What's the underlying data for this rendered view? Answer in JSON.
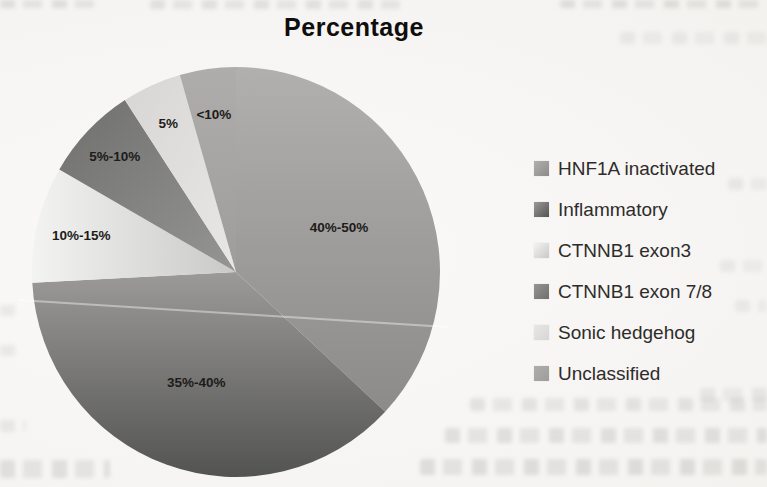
{
  "page": {
    "background_color": "#f6f5f3",
    "title_color": "#0f0e0c",
    "legend_text_color": "#2e2c2a"
  },
  "chart_data": {
    "type": "pie",
    "title": "Percentage",
    "legend_position": "right",
    "grid": false,
    "direction": "clockwise",
    "geometry": {
      "cx": 236,
      "cy": 272,
      "rx": 204,
      "ry": 205,
      "start_bearing_deg": 0
    },
    "slices": [
      {
        "name": "HNF1A inactivated",
        "label": "40%-50%",
        "angle_deg": 133,
        "share_pct": 36.9,
        "color_start": "#b1b0ae",
        "color_end": "#8c8b89",
        "gradient_dir": "down",
        "label_r": 0.55
      },
      {
        "name": "Inflammatory",
        "label": "35%-40%",
        "angle_deg": 134,
        "share_pct": 37.2,
        "color_start": "#9b9a98",
        "color_end": "#535351",
        "gradient_dir": "down",
        "label_r": 0.57
      },
      {
        "name": "CTNNB1 exon3",
        "label": "10%-15%",
        "angle_deg": 33,
        "share_pct": 9.2,
        "color_start": "#f3f3f1",
        "color_end": "#c9c9c7",
        "gradient_dir": "right",
        "label_r": 0.78
      },
      {
        "name": "CTNNB1 exon 7/8",
        "label": "5%-10%",
        "angle_deg": 27,
        "share_pct": 7.5,
        "color_start": "#959593",
        "color_end": "#6f6f6d",
        "gradient_dir": "up-left",
        "label_r": 0.82
      },
      {
        "name": "Sonic hedgehog",
        "label": "5%",
        "angle_deg": 17,
        "share_pct": 4.7,
        "color_start": "#e8e7e5",
        "color_end": "#d7d6d4",
        "gradient_dir": "up-left",
        "label_r": 0.8
      },
      {
        "name": "Unclassified",
        "label": "<10%",
        "angle_deg": 16,
        "share_pct": 4.4,
        "color_start": "#aeadab",
        "color_end": "#9e9d9b",
        "gradient_dir": "down",
        "label_r": 0.78
      }
    ]
  }
}
